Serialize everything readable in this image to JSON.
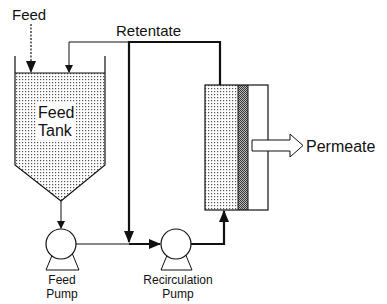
{
  "diagram": {
    "type": "process-flow",
    "labels": {
      "feed_in": "Feed",
      "retentate": "Retentate",
      "tank_line1": "Feed",
      "tank_line2": "Tank",
      "permeate": "Permeate",
      "feed_pump_line1": "Feed",
      "feed_pump_line2": "Pump",
      "recirc_pump_line1": "Recirculation",
      "recirc_pump_line2": "Pump"
    },
    "nodes": [
      {
        "id": "feed-tank",
        "label": "Feed Tank"
      },
      {
        "id": "feed-pump",
        "label": "Feed Pump"
      },
      {
        "id": "recirculation-pump",
        "label": "Recirculation Pump"
      },
      {
        "id": "membrane-module",
        "label": ""
      }
    ],
    "edges": [
      {
        "from": "Feed",
        "to": "feed-tank",
        "style": "dashed"
      },
      {
        "from": "feed-tank",
        "to": "feed-pump"
      },
      {
        "from": "feed-pump",
        "to": "recirculation-pump"
      },
      {
        "from": "recirculation-pump",
        "to": "membrane-module",
        "style": "thick"
      },
      {
        "from": "membrane-module",
        "to": "recirculation-pump",
        "label": "Retentate",
        "style": "thick"
      },
      {
        "from": "membrane-module",
        "to": "feed-tank",
        "label": "Retentate"
      },
      {
        "from": "membrane-module",
        "to": "Permeate",
        "style": "block-arrow"
      }
    ]
  }
}
